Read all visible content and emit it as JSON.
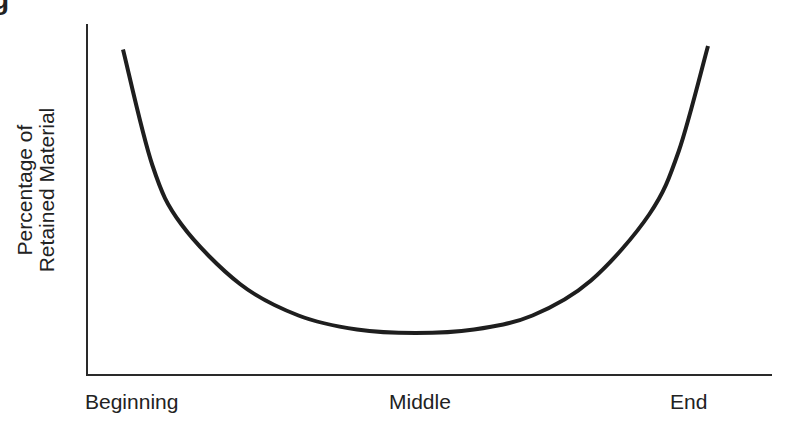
{
  "caption_fragment": "g",
  "chart_data": {
    "type": "line",
    "title": "",
    "xlabel": "",
    "ylabel": "Percentage of Retained Material",
    "ylabel_lines": [
      "Percentage of",
      "Retained Material"
    ],
    "categories": [
      "Beginning",
      "Middle",
      "End"
    ],
    "x_tick_labels": [
      "Beginning",
      "Middle",
      "End"
    ],
    "y_tick_labels": [],
    "grid": false,
    "legend": null,
    "series": [
      {
        "name": "Retention (serial position curve)",
        "description": "U-shaped curve: high at beginning, lowest in middle, highest at end",
        "x": [
          0.0,
          0.05,
          0.1,
          0.2,
          0.3,
          0.4,
          0.5,
          0.6,
          0.7,
          0.8,
          0.9,
          0.95,
          1.0
        ],
        "values": [
          95,
          62,
          45,
          28,
          19,
          15,
          14,
          15,
          19,
          29,
          48,
          66,
          96
        ]
      }
    ],
    "ylim": [
      0,
      100
    ],
    "xlim": [
      0,
      1
    ]
  }
}
